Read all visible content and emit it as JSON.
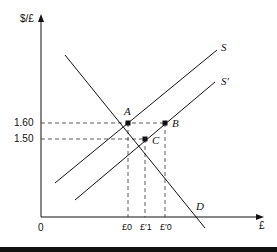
{
  "diagram": {
    "y_axis_label": "$/£",
    "x_axis_label": "£",
    "origin_label": "0",
    "y_ticks": [
      "1.60",
      "1.50"
    ],
    "x_ticks": [
      "£0",
      "£′1",
      "£′0"
    ],
    "curves": [
      {
        "name": "S",
        "label": "S"
      },
      {
        "name": "S′",
        "label": "S′"
      },
      {
        "name": "D",
        "label": "D"
      }
    ],
    "points": [
      {
        "label": "A",
        "price": "1.60",
        "quantity": "£0"
      },
      {
        "label": "B",
        "price": "1.60",
        "quantity": "£′0"
      },
      {
        "label": "C",
        "price": "1.50",
        "quantity": "£′1"
      }
    ]
  }
}
